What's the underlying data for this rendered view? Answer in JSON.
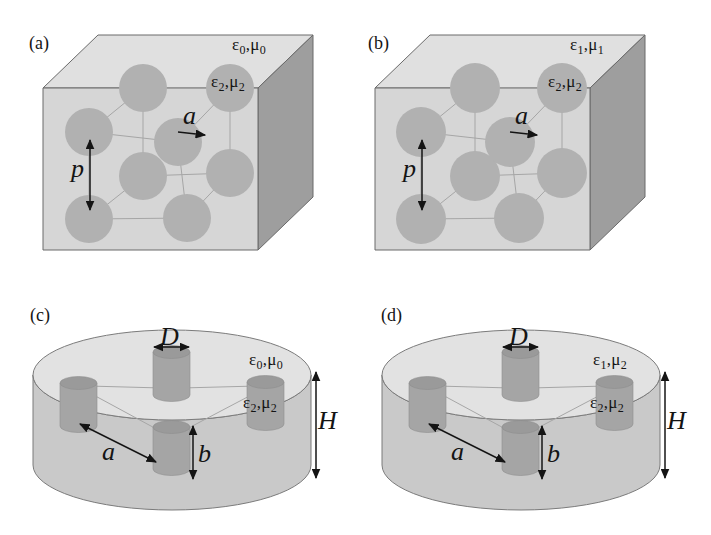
{
  "colors": {
    "background": "#ffffff",
    "cube_front_face": "#d6d6d6",
    "cube_top_face": "#e0e0e0",
    "cube_right_face": "#9e9e9e",
    "sphere": "#b1b1b1",
    "disk_top": "#e2e2e2",
    "disk_side": "#c9c9c9",
    "cylinder_body": "#a5a5a5",
    "cylinder_top": "#9a9a9a",
    "lattice_line": "#a6a6a6",
    "outline": "#6a6a6a",
    "arrow_and_text": "#141414"
  },
  "panels": {
    "a": {
      "letter": "(a)",
      "matrix_label": {
        "base1": "ε",
        "sub1": "0",
        "sep": ",",
        "base2": "μ",
        "sub2": "0"
      },
      "inclusion_label": {
        "base1": "ε",
        "sub1": "2",
        "sep": ",",
        "base2": "μ",
        "sub2": "2"
      },
      "dims": {
        "p": "p",
        "a": "a"
      }
    },
    "b": {
      "letter": "(b)",
      "matrix_label": {
        "base1": "ε",
        "sub1": "1",
        "sep": ",",
        "base2": "μ",
        "sub2": "1"
      },
      "inclusion_label": {
        "base1": "ε",
        "sub1": "2",
        "sep": ",",
        "base2": "μ",
        "sub2": "2"
      },
      "dims": {
        "p": "p",
        "a": "a"
      }
    },
    "c": {
      "letter": "(c)",
      "matrix_label": {
        "base1": "ε",
        "sub1": "0",
        "sep": ",",
        "base2": "μ",
        "sub2": "0"
      },
      "inclusion_label": {
        "base1": "ε",
        "sub1": "2",
        "sep": ",",
        "base2": "μ",
        "sub2": "2"
      },
      "dims": {
        "D": "D",
        "a": "a",
        "b": "b",
        "H": "H"
      }
    },
    "d": {
      "letter": "(d)",
      "matrix_label": {
        "base1": "ε",
        "sub1": "1",
        "sep": ",",
        "base2": "μ",
        "sub2": "2"
      },
      "inclusion_label": {
        "base1": "ε",
        "sub1": "2",
        "sep": ",",
        "base2": "μ",
        "sub2": "2"
      },
      "dims": {
        "D": "D",
        "a": "a",
        "b": "b",
        "H": "H"
      }
    }
  }
}
